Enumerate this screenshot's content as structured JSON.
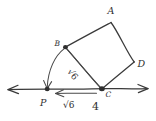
{
  "figure": {
    "kind": "hand-drawn-geometry-sketch",
    "background_color": "#ffffff",
    "ink_color": "#3a3a3a",
    "labels": {
      "vertex_a": "A",
      "vertex_b": "B",
      "vertex_c": "C",
      "vertex_d": "D",
      "point_p": "P",
      "segment_pc_length": "√6",
      "diagonal_bc_length": "√6",
      "side_measure": "4"
    },
    "square": {
      "name": "square-abdc",
      "vertices": [
        {
          "label": "A",
          "x": 111,
          "y": 22
        },
        {
          "label": "B",
          "x": 65,
          "y": 47
        },
        {
          "label": "C",
          "x": 102,
          "y": 89
        },
        {
          "label": "D",
          "x": 134,
          "y": 62
        }
      ]
    },
    "number_line": {
      "name": "horizontal-line-through-p-and-c",
      "x1": 6,
      "x2": 150,
      "y": 89,
      "left_arrow": true,
      "right_arrow": true
    },
    "point_p": {
      "x": 47,
      "y": 89
    },
    "arc": {
      "name": "arc-b-to-p",
      "from": {
        "x": 65,
        "y": 47
      },
      "to": {
        "x": 47,
        "y": 89
      },
      "arrowhead_at": "p"
    },
    "diagonal": {
      "name": "diagonal-b-to-c",
      "from": {
        "x": 65,
        "y": 47
      },
      "to": {
        "x": 102,
        "y": 89
      }
    },
    "measure_arrow_pc": {
      "name": "measure-arrow-from-c-to-p",
      "from": {
        "x": 97,
        "y": 93
      },
      "to": {
        "x": 54,
        "y": 93
      }
    }
  }
}
